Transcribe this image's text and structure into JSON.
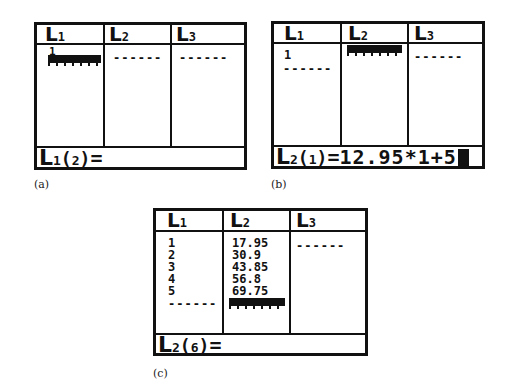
{
  "screens": [
    {
      "caption": "(a)",
      "headers": [
        {
          "letter": "L",
          "num": "1"
        },
        {
          "letter": "L",
          "num": "2"
        },
        {
          "letter": "L",
          "num": "3"
        }
      ],
      "columns": [
        {
          "values": [
            "1"
          ],
          "cursor": true
        },
        {
          "values": [],
          "end_marker": "------"
        },
        {
          "values": [],
          "end_marker": "------"
        }
      ],
      "status": {
        "letter": "L",
        "list": "1",
        "index": "2",
        "expr": ""
      }
    },
    {
      "caption": "(b)",
      "headers": [
        {
          "letter": "L",
          "num": "1"
        },
        {
          "letter": "L",
          "num": "2"
        },
        {
          "letter": "L",
          "num": "3"
        }
      ],
      "columns": [
        {
          "values": [
            "1"
          ],
          "end_marker": "------"
        },
        {
          "values": [],
          "cursor": true
        },
        {
          "values": [],
          "end_marker": "------"
        }
      ],
      "status": {
        "letter": "L",
        "list": "2",
        "index": "1",
        "expr": "12.95*1+5",
        "cursor": true
      }
    },
    {
      "caption": "(c)",
      "headers": [
        {
          "letter": "L",
          "num": "1"
        },
        {
          "letter": "L",
          "num": "2"
        },
        {
          "letter": "L",
          "num": "3"
        }
      ],
      "columns": [
        {
          "values": [
            "1",
            "2",
            "3",
            "4",
            "5"
          ],
          "end_marker": "------"
        },
        {
          "values": [
            "17.95",
            "30.9",
            "43.85",
            "56.8",
            "69.75"
          ],
          "cursor": true
        },
        {
          "values": [],
          "end_marker": "------"
        }
      ],
      "status": {
        "letter": "L",
        "list": "2",
        "index": "6",
        "expr": ""
      }
    }
  ],
  "colors": {
    "ink": "#111111",
    "background": "#ffffff"
  }
}
